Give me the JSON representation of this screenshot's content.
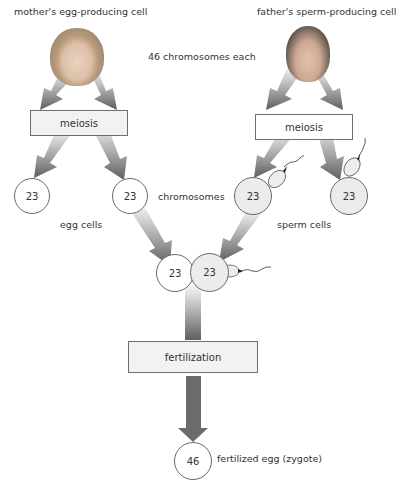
{
  "labels": {
    "mother": "mother's egg-producing cell",
    "father": "father's sperm-producing cell",
    "chromosomes_each": "46 chromosomes each",
    "chromosomes": "chromosomes",
    "egg_cells": "egg cells",
    "sperm_cells": "sperm cells",
    "zygote": "fertilized egg (zygote)"
  },
  "processes": {
    "meiosis_left": "meiosis",
    "meiosis_right": "meiosis",
    "fertilization": "fertilization"
  },
  "cells": {
    "egg_1": "23",
    "egg_2": "23",
    "sperm_1": "23",
    "sperm_2": "23",
    "fusion_egg": "23",
    "fusion_sperm": "23",
    "zygote": "46"
  },
  "colors": {
    "arrow": "#6b6b6b",
    "box_fill": "#f2f2f2",
    "sperm_fill": "#ececec"
  }
}
